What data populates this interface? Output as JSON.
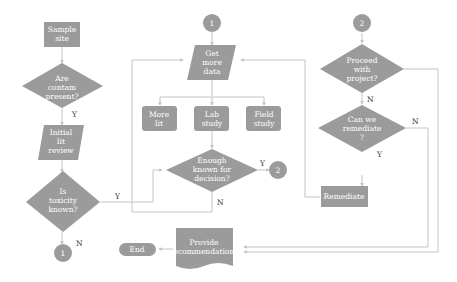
{
  "diagram": {
    "nodes": {
      "sample_site": [
        "Sample",
        "site"
      ],
      "are_contam": [
        "Are",
        "contam",
        "present?"
      ],
      "initial_lit": [
        "Initial",
        "lit",
        "review"
      ],
      "is_toxicity": [
        "Is",
        "toxicity",
        "known?"
      ],
      "connector_1_bottom": "1",
      "connector_1_top": "1",
      "get_more_data": [
        "Get",
        "more",
        "data"
      ],
      "more_lit": [
        "More",
        "lit"
      ],
      "lab_study": [
        "Lab",
        "study"
      ],
      "field_study": [
        "Field",
        "study"
      ],
      "enough_known": [
        "Enough",
        "known for",
        "decision?"
      ],
      "connector_2_mid": "2",
      "connector_2_top": "2",
      "proceed": [
        "Proceed",
        "with",
        "project?"
      ],
      "can_remediate": [
        "Can we",
        "remediate",
        "?"
      ],
      "remediate": "Remediate",
      "provide_recs": [
        "Provide",
        "recommendations"
      ],
      "end": "End"
    },
    "edge_labels": {
      "are_contam_yes": "Y",
      "toxicity_yes": "Y",
      "toxicity_no": "N",
      "enough_yes": "Y",
      "enough_no": "N",
      "proceed_no": "N",
      "remediate_no": "N",
      "remediate_yes": "Y"
    }
  }
}
